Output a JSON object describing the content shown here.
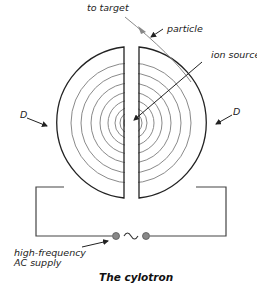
{
  "diagram": {
    "title": "The cylotron",
    "labels": {
      "to_target": "to target",
      "particle": "particle",
      "ion_source": "ion source",
      "dee_left": "D",
      "dee_right": "D",
      "supply_line1": "high-frequency",
      "supply_line2": "AC supply",
      "ac_symbol": "~"
    },
    "colors": {
      "outline": "#222222",
      "orbit": "#8a8a8a",
      "terminal": "#888888",
      "text": "#222222"
    }
  }
}
